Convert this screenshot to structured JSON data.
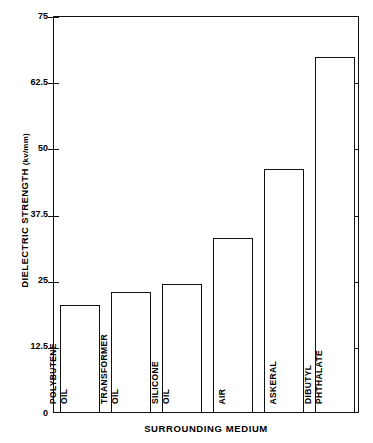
{
  "chart_data": {
    "type": "bar",
    "title": "",
    "xlabel": "SURROUNDING MEDIUM",
    "ylabel": "DIELECTRIC STRENGTH",
    "yunits": "(kv/mm)",
    "ylabel_full": "DIELECTRIC STRENGTH  (kv/mm)",
    "categories": [
      "POLYBUTENE OIL",
      "TRANSFORMER OIL",
      "SILICONE OIL",
      "AIR",
      "ASKERAL",
      "DIBUTYL PHTHALATE"
    ],
    "category_lines": [
      [
        "POLYBUTENE",
        "OIL"
      ],
      [
        "TRANSFORMER",
        "OIL"
      ],
      [
        "SILICONE",
        "OIL"
      ],
      [
        "AIR",
        ""
      ],
      [
        "ASKERAL",
        ""
      ],
      [
        "DIBUTYL",
        "PHTHALATE"
      ]
    ],
    "values": [
      20.2,
      22.7,
      24.2,
      32.9,
      45.9,
      67.1
    ],
    "ylim": [
      0,
      75
    ],
    "yticks": [
      0,
      12.5,
      25,
      37.5,
      50,
      62.5,
      75
    ],
    "ytick_labels": [
      "0",
      "12.5",
      "25",
      "37.5",
      "50",
      "62.5",
      "75"
    ],
    "grid": false,
    "legend": false,
    "bar_fill": "#ffffff",
    "bar_edge": "#111111",
    "axis_color": "#111111",
    "background": "#ffffff"
  }
}
